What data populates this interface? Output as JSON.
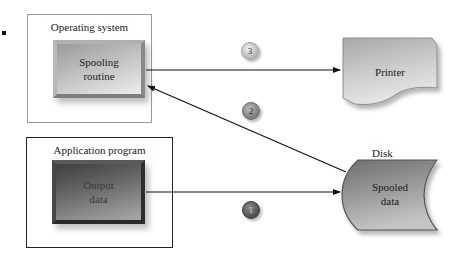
{
  "diagram": {
    "operating_system": {
      "frame_label": "Operating system",
      "spooling_routine_label_line1": "Spooling",
      "spooling_routine_label_line2": "routine"
    },
    "application_program": {
      "frame_label": "Application program",
      "output_data_label_line1": "Output",
      "output_data_label_line2": "data"
    },
    "printer": {
      "label": "Printer"
    },
    "disk": {
      "caption": "Disk",
      "label_line1": "Spooled",
      "label_line2": "data"
    },
    "steps": [
      {
        "number": "1",
        "from": "Output data",
        "to": "Spooled data"
      },
      {
        "number": "2",
        "from": "Spooled data",
        "to": "Spooling routine"
      },
      {
        "number": "3",
        "from": "Spooling routine",
        "to": "Printer"
      }
    ]
  }
}
